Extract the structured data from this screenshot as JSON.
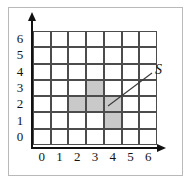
{
  "figure": {
    "title": "",
    "region_label": "S"
  },
  "axes": {
    "x_ticks": [
      "0",
      "1",
      "2",
      "3",
      "4",
      "5",
      "6"
    ],
    "y_ticks": [
      "6",
      "5",
      "4",
      "3",
      "2",
      "1",
      "0"
    ],
    "x_arrow": "right-arrow-icon",
    "y_arrow": "up-arrow-icon"
  },
  "colors": {
    "grid_line": "#4c4c4c",
    "shade_fill": "#c9c9c9",
    "axis": "#111111",
    "frame": "#b9b9b9",
    "background": "#ffffff"
  },
  "chart_data": {
    "type": "heatmap",
    "title": "",
    "xlabel": "",
    "ylabel": "",
    "xlim": [
      0,
      7
    ],
    "ylim": [
      0,
      7
    ],
    "grid": true,
    "legend": "none",
    "annotations": [
      {
        "text": "S",
        "points_to": "shaded-region",
        "x": 4.1,
        "y": 2.4
      }
    ],
    "columns": [
      "0",
      "1",
      "2",
      "3",
      "4",
      "5",
      "6"
    ],
    "rows": [
      "6",
      "5",
      "4",
      "3",
      "2",
      "1",
      "0"
    ],
    "comment_row_order": "rows listed top-to-bottom as drawn",
    "values": [
      [
        0,
        0,
        0,
        0,
        0,
        0,
        0
      ],
      [
        0,
        0,
        0,
        0,
        0,
        0,
        0
      ],
      [
        0,
        0,
        0,
        0,
        0,
        0,
        0
      ],
      [
        0,
        0,
        0,
        1,
        0,
        0,
        0
      ],
      [
        0,
        0,
        1,
        1,
        1,
        0,
        0
      ],
      [
        0,
        0,
        0,
        0,
        1,
        0,
        0
      ],
      [
        0,
        0,
        0,
        0,
        0,
        0,
        0
      ]
    ],
    "shaded_cells": [
      {
        "col": 3,
        "row": 3
      },
      {
        "col": 2,
        "row": 2
      },
      {
        "col": 3,
        "row": 2
      },
      {
        "col": 4,
        "row": 2
      },
      {
        "col": 4,
        "row": 1
      }
    ],
    "shaded_count": 5
  }
}
